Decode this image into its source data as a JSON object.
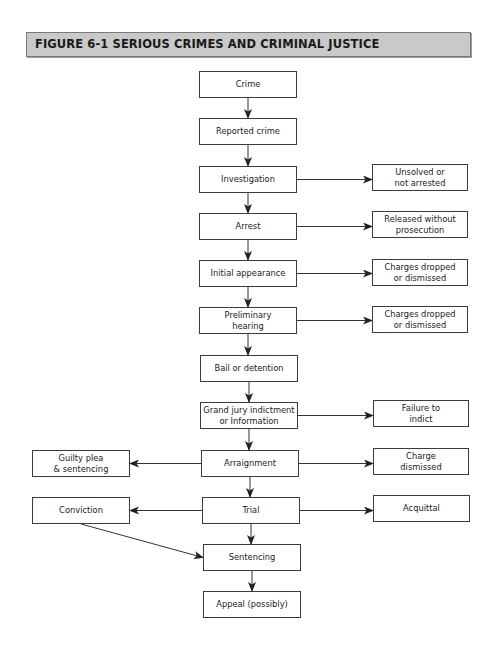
{
  "figure": {
    "title": "FIGURE 6-1  SERIOUS CRIMES AND CRIMINAL JUSTICE",
    "header_color": "#c9c9c9",
    "line_color": "#333333"
  },
  "nodes": {
    "crime": "Crime",
    "reported_crime": "Reported crime",
    "investigation": "Investigation",
    "arrest": "Arrest",
    "initial_appearance": "Initial appearance",
    "preliminary_hearing": "Preliminary\nhearing",
    "bail_or_detention": "Bail or detention",
    "grand_jury": "Grand jury indictment\nor Information",
    "arraignment": "Arraignment",
    "trial": "Trial",
    "sentencing": "Sentencing",
    "appeal": "Appeal (possibly)",
    "unsolved": "Unsolved or\nnot arrested",
    "released": "Released without\nprosecution",
    "charges_dropped_1": "Charges dropped\nor dismissed",
    "charges_dropped_2": "Charges dropped\nor dismissed",
    "failure_to_indict": "Failure to\nindict",
    "charge_dismissed": "Charge\ndismissed",
    "acquittal": "Acquittal",
    "guilty_plea": "Guilty plea\n& sentencing",
    "conviction": "Conviction"
  },
  "edges": [
    [
      "crime",
      "reported_crime"
    ],
    [
      "reported_crime",
      "investigation"
    ],
    [
      "investigation",
      "arrest"
    ],
    [
      "arrest",
      "initial_appearance"
    ],
    [
      "initial_appearance",
      "preliminary_hearing"
    ],
    [
      "preliminary_hearing",
      "bail_or_detention"
    ],
    [
      "bail_or_detention",
      "grand_jury"
    ],
    [
      "grand_jury",
      "arraignment"
    ],
    [
      "arraignment",
      "trial"
    ],
    [
      "trial",
      "sentencing"
    ],
    [
      "sentencing",
      "appeal"
    ],
    [
      "investigation",
      "unsolved"
    ],
    [
      "arrest",
      "released"
    ],
    [
      "initial_appearance",
      "charges_dropped_1"
    ],
    [
      "preliminary_hearing",
      "charges_dropped_2"
    ],
    [
      "grand_jury",
      "failure_to_indict"
    ],
    [
      "arraignment",
      "charge_dismissed"
    ],
    [
      "trial",
      "acquittal"
    ],
    [
      "arraignment",
      "guilty_plea"
    ],
    [
      "trial",
      "conviction"
    ],
    [
      "conviction",
      "sentencing"
    ]
  ]
}
